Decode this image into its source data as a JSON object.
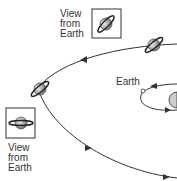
{
  "diagram": {
    "top_view_label": [
      "View",
      "from",
      "Earth"
    ],
    "bottom_view_label": [
      "View",
      "from",
      "Earth"
    ],
    "earth_label": "Earth",
    "colors": {
      "line": "#333333",
      "planet": "#9a9a9a"
    }
  }
}
